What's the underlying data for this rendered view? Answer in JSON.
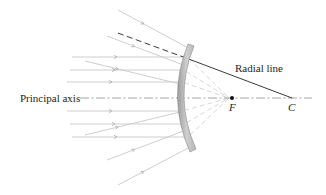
{
  "diagram": {
    "labels": {
      "principal_axis": "Principal axis",
      "radial_line": "Radial line",
      "focal_point": "F",
      "center_of_curvature": "C"
    },
    "colors": {
      "ray": "#c8c8c8",
      "ray_arrow": "#b4b4b4",
      "reflected_dashed": "#d2d2d2",
      "mirror_fill": "#c4c4c4",
      "mirror_edge": "#8a8a8a",
      "radial_line": "#3a3a3a",
      "axis": "#9a9a9a",
      "text": "#231f20",
      "focal_dot": "#111111"
    },
    "elements": {
      "mirror_type": "convex",
      "incident_parallel_rays": 6,
      "incident_oblique_rays": 6,
      "virtual_rays_converge_at": "F"
    }
  }
}
